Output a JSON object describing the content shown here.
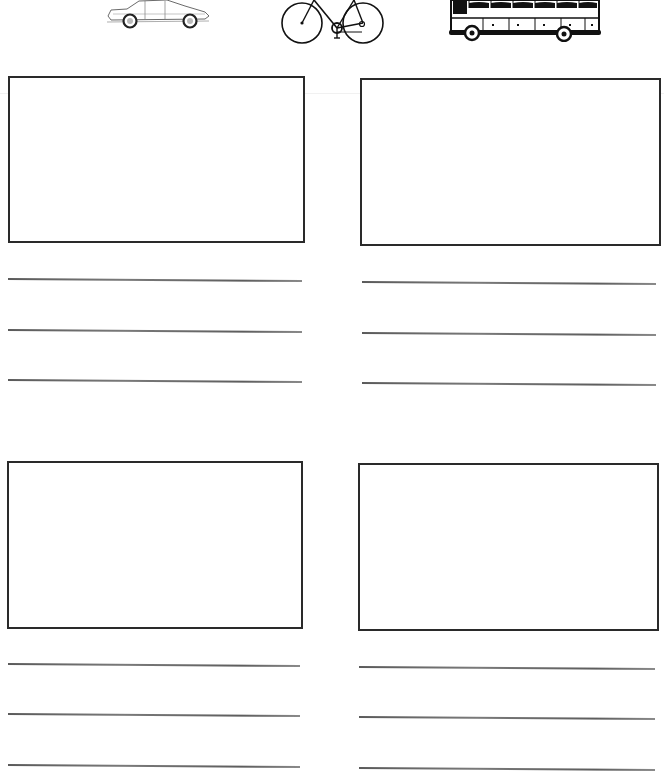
{
  "worksheet": {
    "header_images": [
      {
        "name": "car",
        "icon": "car-icon"
      },
      {
        "name": "bicycle",
        "icon": "bicycle-icon"
      },
      {
        "name": "bus",
        "icon": "bus-icon"
      }
    ],
    "panels": [
      {
        "position": "top-left",
        "writing_lines": 3
      },
      {
        "position": "top-right",
        "writing_lines": 3
      },
      {
        "position": "bottom-left",
        "writing_lines": 3
      },
      {
        "position": "bottom-right",
        "writing_lines": 3
      }
    ],
    "colors": {
      "border": "#2a2a2a",
      "line": "#6a6a6a",
      "background": "#ffffff"
    }
  }
}
